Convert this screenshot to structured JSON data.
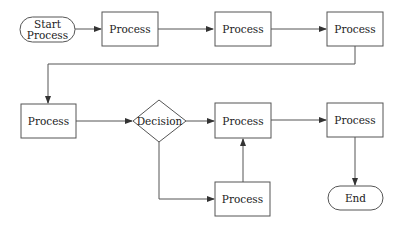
{
  "diagram": {
    "type": "flowchart",
    "nodes": [
      {
        "id": "start",
        "shape": "terminator",
        "label_line1": "Start",
        "label_line2": "Process"
      },
      {
        "id": "p1",
        "shape": "process",
        "label": "Process"
      },
      {
        "id": "p2",
        "shape": "process",
        "label": "Process"
      },
      {
        "id": "p3",
        "shape": "process",
        "label": "Process"
      },
      {
        "id": "p4",
        "shape": "process",
        "label": "Process"
      },
      {
        "id": "d1",
        "shape": "decision",
        "label": "Decision"
      },
      {
        "id": "p5",
        "shape": "process",
        "label": "Process"
      },
      {
        "id": "p6",
        "shape": "process",
        "label": "Process"
      },
      {
        "id": "p7",
        "shape": "process",
        "label": "Process"
      },
      {
        "id": "end",
        "shape": "terminator",
        "label": "End"
      }
    ],
    "edges": [
      {
        "from": "start",
        "to": "p1"
      },
      {
        "from": "p1",
        "to": "p2"
      },
      {
        "from": "p2",
        "to": "p3"
      },
      {
        "from": "p3",
        "to": "p4"
      },
      {
        "from": "p4",
        "to": "d1"
      },
      {
        "from": "d1",
        "to": "p5"
      },
      {
        "from": "d1",
        "to": "p7"
      },
      {
        "from": "p7",
        "to": "p5"
      },
      {
        "from": "p5",
        "to": "p6"
      },
      {
        "from": "p6",
        "to": "end"
      }
    ],
    "colors": {
      "stroke": "#555555",
      "text": "#222222",
      "background": "#ffffff"
    }
  }
}
